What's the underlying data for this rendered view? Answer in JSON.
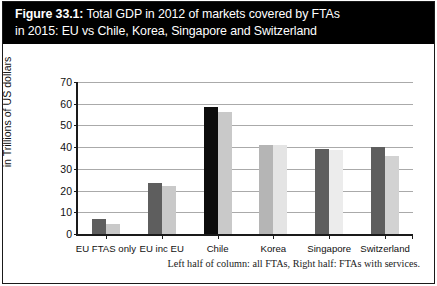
{
  "figure": {
    "label": "Figure 33.1:",
    "title_line1": " Total GDP in 2012 of markets covered by FTAs",
    "title_line2": "in 2015: EU vs Chile, Korea, Singapore and Switzerland",
    "footnote": "Left half of column: all FTAs, Right half: FTAs with services."
  },
  "colors": {
    "banner_background": "#000000",
    "banner_text": "#ffffff",
    "series_all_ftas": "#5e5e5e",
    "series_all_ftas_chile": "#0d0d0d",
    "series_with_services": "#c9c9c9",
    "series_with_services_light": "#e9e9e9",
    "gridline": "#aaaaaa",
    "axis": "#1a1a1a"
  },
  "chart_data": {
    "type": "bar",
    "title": "Figure 33.1: Total GDP in 2012 of markets covered by FTAs in 2015: EU vs Chile, Korea, Singapore and Switzerland",
    "xlabel": "",
    "ylabel": "Total 2012 GDP of partner countries in Trillions of US dollars",
    "ylabel_line1": "Total 2012 GDP of partner countries",
    "ylabel_line2": "in Trillions of US dollars",
    "ylim": [
      0,
      70
    ],
    "yticks": [
      0,
      10,
      20,
      30,
      40,
      50,
      60,
      70
    ],
    "ytick_labels": [
      "0",
      "10",
      "20",
      "30",
      "40",
      "50",
      "60",
      "70"
    ],
    "grid": true,
    "legend_position": "none",
    "annotation": "Left half of column: all FTAs, Right half: FTAs with services.",
    "categories": [
      "EU FTAS only",
      "EU inc EU",
      "Chile",
      "Korea",
      "Singapore",
      "Switzerland"
    ],
    "series": [
      {
        "name": "all FTAs",
        "values": [
          7,
          23.5,
          58.5,
          41,
          39,
          40
        ]
      },
      {
        "name": "FTAs with services",
        "values": [
          4.5,
          22,
          56,
          41,
          38.5,
          36
        ]
      }
    ],
    "bars": [
      {
        "category": "EU FTAS only",
        "left_value": 7,
        "right_value": 4.5,
        "left_color": "#5e5e5e",
        "right_color": "#c9c9c9"
      },
      {
        "category": "EU inc EU",
        "left_value": 23.5,
        "right_value": 22,
        "left_color": "#5e5e5e",
        "right_color": "#c9c9c9"
      },
      {
        "category": "Chile",
        "left_value": 58.5,
        "right_value": 56,
        "left_color": "#0d0d0d",
        "right_color": "#c9c9c9"
      },
      {
        "category": "Korea",
        "left_value": 41,
        "right_value": 41,
        "left_color": "#b5b5b5",
        "right_color": "#e4e4e4"
      },
      {
        "category": "Singapore",
        "left_value": 39,
        "right_value": 38.5,
        "left_color": "#5e5e5e",
        "right_color": "#ececec"
      },
      {
        "category": "Switzerland",
        "left_value": 40,
        "right_value": 36,
        "left_color": "#5e5e5e",
        "right_color": "#d2d2d2"
      }
    ]
  }
}
